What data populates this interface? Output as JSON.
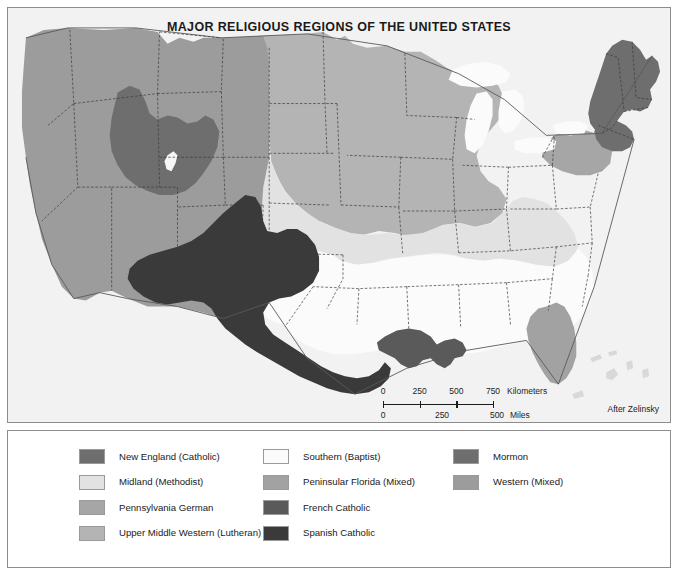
{
  "map": {
    "title": "MAJOR RELIGIOUS REGIONS OF THE UNITED STATES",
    "attribution": "After Zelinsky",
    "background_color": "#f2f2f2",
    "border_color": "#8d8d8d",
    "water_color": "#ffffff",
    "state_border_color": "#3a3a3a"
  },
  "scalebar": {
    "km": {
      "ticks": [
        "0",
        "250",
        "500",
        "750"
      ],
      "unit": "Kilometers"
    },
    "mi": {
      "ticks": [
        "0",
        "250",
        "500"
      ],
      "unit": "Miles"
    }
  },
  "legend": {
    "columns": [
      {
        "items": [
          {
            "label": "New England (Catholic)",
            "color": "#6e6e6e"
          },
          {
            "label": "Midland (Methodist)",
            "color": "#e2e2e2"
          },
          {
            "label": "Pennsylvania German",
            "color": "#a6a6a6"
          },
          {
            "label": "Upper Middle Western (Lutheran)",
            "color": "#b4b4b4"
          }
        ]
      },
      {
        "items": [
          {
            "label": "Southern (Baptist)",
            "color": "#fbfbfb"
          },
          {
            "label": "Peninsular Florida (Mixed)",
            "color": "#a2a2a2"
          },
          {
            "label": "French Catholic",
            "color": "#5a5a5a"
          },
          {
            "label": "Spanish Catholic",
            "color": "#3a3a3a"
          }
        ]
      },
      {
        "items": [
          {
            "label": "Mormon",
            "color": "#6e6e6e"
          },
          {
            "label": "Western (Mixed)",
            "color": "#9c9c9c"
          }
        ]
      }
    ]
  },
  "regions": {
    "western_mixed": "#9c9c9c",
    "mormon": "#6e6e6e",
    "spanish_catholic": "#3a3a3a",
    "french_catholic": "#5a5a5a",
    "upper_middle_western": "#b4b4b4",
    "midland": "#e2e2e2",
    "southern_baptist": "#fbfbfb",
    "pennsylvania_german": "#a6a6a6",
    "new_england": "#6e6e6e",
    "peninsular_florida": "#a2a2a2"
  }
}
